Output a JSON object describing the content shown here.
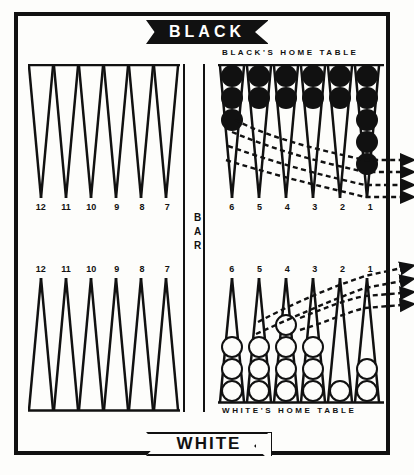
{
  "banners": {
    "top": {
      "label": "BLACK",
      "style": "solid-black-ribbon"
    },
    "bottom": {
      "label": "WHITE",
      "style": "outlined-ribbon"
    }
  },
  "labels": {
    "black_home": "BLACK'S HOME TABLE",
    "white_home": "WHITE'S HOME TABLE",
    "bar": "BAR"
  },
  "colors": {
    "ink": "#111111",
    "paper": "#fdfdfb",
    "black_checker": "#111111",
    "white_checker": "#fdfdfb"
  },
  "quadrants": {
    "black_outer": {
      "point_numbers": [
        "12",
        "11",
        "10",
        "9",
        "8",
        "7"
      ],
      "checkers": 0
    },
    "white_outer": {
      "point_numbers": [
        "12",
        "11",
        "10",
        "9",
        "8",
        "7"
      ],
      "checkers": 0
    },
    "black_home": {
      "point_numbers": [
        "6",
        "5",
        "4",
        "3",
        "2",
        "1"
      ],
      "checker_color": "black",
      "counts": [
        3,
        2,
        2,
        2,
        2,
        5
      ]
    },
    "white_home": {
      "point_numbers": [
        "6",
        "5",
        "4",
        "3",
        "2",
        "1"
      ],
      "checker_color": "white",
      "counts": [
        3,
        3,
        4,
        3,
        1,
        2
      ]
    }
  },
  "bearing_off": {
    "black_arrows": 4,
    "white_arrows": 4,
    "arrow_style": "dashed-curve-with-arrowhead",
    "direction": "right"
  },
  "chart_data": {
    "type": "table",
    "categories": [
      "6",
      "5",
      "4",
      "3",
      "2",
      "1"
    ],
    "series": [
      {
        "name": "Black home table",
        "values": [
          3,
          2,
          2,
          2,
          2,
          5
        ]
      },
      {
        "name": "White home table",
        "values": [
          3,
          3,
          4,
          3,
          1,
          2
        ]
      }
    ],
    "xlabel": "Point number",
    "ylabel": "Checkers on point"
  }
}
